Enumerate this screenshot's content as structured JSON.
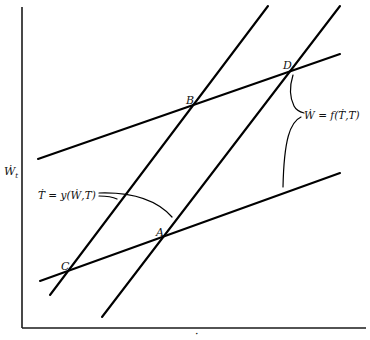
{
  "figure": {
    "y_axis_label": "Ẇ",
    "y_axis_label_subscript": "t",
    "x_axis_label": "·",
    "points": {
      "A": "A",
      "B": "B",
      "C": "C",
      "D": "D"
    },
    "equations": {
      "t_dot": "Ṫ = y(Ẇ,T)",
      "w_dot": "Ẇ = f(Ṫ,T)"
    },
    "lines": [
      {
        "name": "wage-schedule-upper",
        "x1": 38,
        "y1": 159,
        "x2": 340,
        "y2": 54
      },
      {
        "name": "wage-schedule-lower",
        "x1": 40,
        "y1": 281,
        "x2": 340,
        "y2": 173
      },
      {
        "name": "t-schedule-left",
        "x1": 50,
        "y1": 295,
        "x2": 268,
        "y2": 6
      },
      {
        "name": "t-schedule-right",
        "x1": 102,
        "y1": 317,
        "x2": 340,
        "y2": 6
      }
    ],
    "colors": {
      "line": "#000000",
      "axis": "#1a1a1a",
      "background": "#ffffff"
    }
  }
}
